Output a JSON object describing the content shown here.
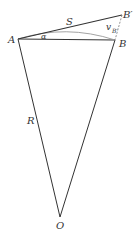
{
  "diagram": {
    "labels": {
      "A": "A",
      "B": "B",
      "B_prime": "B′",
      "O": "O",
      "S": "S",
      "R": "R",
      "alpha": "α",
      "v": "v",
      "v_sub": "B′"
    },
    "points": {
      "A": [
        18,
        39
      ],
      "B": [
        115,
        40
      ],
      "B_prime": [
        122,
        15
      ],
      "O": [
        60,
        217
      ]
    },
    "colors": {
      "line": "#333333",
      "arc": "#999999",
      "dashed": "#777777"
    }
  }
}
